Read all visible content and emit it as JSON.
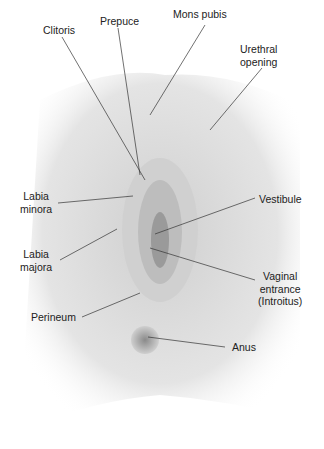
{
  "diagram": {
    "type": "labeled anatomical illustration",
    "style": "grayscale shaded drawing with leader lines",
    "colors": {
      "background": "#ffffff",
      "shading": "#b8b8b8",
      "line": "#333333",
      "text": "#222222"
    }
  },
  "labels": {
    "clitoris": "Clitoris",
    "prepuce": "Prepuce",
    "mons_pubis": "Mons pubis",
    "urethral_opening": "Urethral\nopening",
    "labia_minora": "Labia\nminora",
    "vestibule": "Vestibule",
    "labia_majora": "Labia\nmajora",
    "vaginal_entrance": "Vaginal\nentrance\n(Introitus)",
    "perineum": "Perineum",
    "anus": "Anus"
  }
}
